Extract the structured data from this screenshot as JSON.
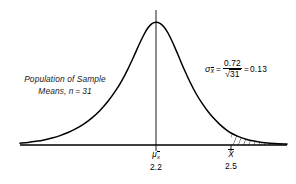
{
  "figure": {
    "type": "sampling-distribution-curve",
    "width": 296,
    "height": 184,
    "background_color": "#ffffff",
    "line_color": "#000000"
  },
  "annotations": {
    "population_label_line1": "Population of Sample",
    "population_label_line2": "Means, n = 31"
  },
  "formula": {
    "lhs_symbol": "σ",
    "lhs_subscript": "x",
    "equals": "=",
    "numerator": "0.72",
    "radical_symbol": "√",
    "radicand": "31",
    "equals2": "=",
    "result": "0.13"
  },
  "axis": {
    "mean_tick": {
      "symbol": "μ",
      "subscript": "x",
      "value": "2.2"
    },
    "sample_tick": {
      "symbol": "X",
      "value": "2.5"
    }
  },
  "chart_data": {
    "type": "line",
    "title": "",
    "subtitle": "",
    "xlabel": "",
    "ylabel": "",
    "grid": false,
    "legend": null,
    "curve_description": "Leptokurtic bell-shaped sampling distribution of sample means",
    "distribution": {
      "mean": 2.2,
      "standard_error": 0.13,
      "sample_size": 31,
      "population_sd": 0.72
    },
    "x_tick_values": [
      2.2,
      2.5
    ],
    "x_tick_labels": [
      "2.2",
      "2.5"
    ],
    "shaded_region": {
      "from": 2.5,
      "to": null,
      "style": "hatched",
      "label": "right tail"
    },
    "markers": [
      {
        "x": 2.2,
        "label": "μ x̄",
        "type": "vertical-line"
      },
      {
        "x": 2.5,
        "label": "X̄",
        "type": "tick"
      }
    ],
    "curve_points": [
      {
        "x": 20,
        "y": 143.2
      },
      {
        "x": 28,
        "y": 142.4
      },
      {
        "x": 36,
        "y": 141.3
      },
      {
        "x": 44,
        "y": 139.9
      },
      {
        "x": 52,
        "y": 138.0
      },
      {
        "x": 60,
        "y": 135.6
      },
      {
        "x": 68,
        "y": 132.5
      },
      {
        "x": 76,
        "y": 128.6
      },
      {
        "x": 84,
        "y": 123.8
      },
      {
        "x": 92,
        "y": 117.8
      },
      {
        "x": 100,
        "y": 110.4
      },
      {
        "x": 108,
        "y": 101.3
      },
      {
        "x": 116,
        "y": 90.2
      },
      {
        "x": 122,
        "y": 80.3
      },
      {
        "x": 128,
        "y": 68.8
      },
      {
        "x": 134,
        "y": 56.0
      },
      {
        "x": 139,
        "y": 44.8
      },
      {
        "x": 144,
        "y": 34.5
      },
      {
        "x": 148,
        "y": 27.8
      },
      {
        "x": 152,
        "y": 23.6
      },
      {
        "x": 156,
        "y": 22.2
      },
      {
        "x": 160,
        "y": 23.3
      },
      {
        "x": 164,
        "y": 26.9
      },
      {
        "x": 168,
        "y": 33.0
      },
      {
        "x": 173,
        "y": 43.2
      },
      {
        "x": 178,
        "y": 54.8
      },
      {
        "x": 184,
        "y": 69.0
      },
      {
        "x": 190,
        "y": 82.0
      },
      {
        "x": 196,
        "y": 93.5
      },
      {
        "x": 202,
        "y": 103.2
      },
      {
        "x": 208,
        "y": 111.5
      },
      {
        "x": 214,
        "y": 118.6
      },
      {
        "x": 220,
        "y": 124.6
      },
      {
        "x": 226,
        "y": 129.6
      },
      {
        "x": 231,
        "y": 133.0
      },
      {
        "x": 238,
        "y": 136.4
      },
      {
        "x": 246,
        "y": 139.2
      },
      {
        "x": 254,
        "y": 141.1
      },
      {
        "x": 262,
        "y": 142.4
      },
      {
        "x": 270,
        "y": 143.2
      },
      {
        "x": 278,
        "y": 143.8
      },
      {
        "x": 287,
        "y": 144.1
      }
    ],
    "baseline_y": 145,
    "axis_x_start": 20,
    "axis_x_end": 287
  }
}
